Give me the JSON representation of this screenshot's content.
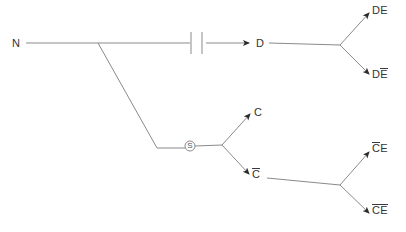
{
  "diagram": {
    "type": "game-tree",
    "background_color": "#ffffff",
    "line_color": "#8a8a8a",
    "arrow_color": "#2b2b2b",
    "text_color": "#333333",
    "nodes": [
      {
        "id": "n-root",
        "label": "N",
        "overline": "none",
        "x": 12,
        "y": 38
      },
      {
        "id": "n-d",
        "label": "D",
        "overline": "none",
        "x": 256,
        "y": 38
      },
      {
        "id": "n-de",
        "label": "DE",
        "overline": "none",
        "x": 372,
        "y": 5
      },
      {
        "id": "n-de-bar",
        "label": "DE",
        "overline": "last",
        "x": 372,
        "y": 68
      },
      {
        "id": "n-c",
        "label": "C",
        "overline": "none",
        "x": 254,
        "y": 107
      },
      {
        "id": "n-c-bar",
        "label": "C",
        "overline": "all",
        "x": 252,
        "y": 168
      },
      {
        "id": "n-cbar-e",
        "label": "CE",
        "overline": "first",
        "x": 372,
        "y": 142
      },
      {
        "id": "n-cbar-ebar",
        "label": "CE",
        "overline": "all",
        "x": 372,
        "y": 204
      }
    ],
    "chance_node": {
      "id": "switch-node",
      "label": "S",
      "x": 190,
      "y": 145,
      "radius": 5
    },
    "information_set": {
      "id": "info-set-bars",
      "x": 195,
      "y": 43,
      "width": 11,
      "height": 22
    }
  }
}
